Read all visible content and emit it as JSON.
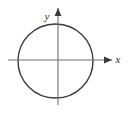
{
  "figure": {
    "background_color": "#ffffff",
    "width": 128,
    "height": 113
  },
  "axes": {
    "x_axis": {
      "label": "x",
      "label_x": 118,
      "label_y": 63,
      "line_start_x": 8,
      "line_end_x": 112,
      "line_y": 60,
      "color": "#6e6e6e",
      "arrow": "right-arrowhead"
    },
    "y_axis": {
      "label": "y",
      "label_x": 45,
      "label_y": 20,
      "line_top_y": 8,
      "line_bottom_y": 105,
      "line_x": 58,
      "color": "#6e6e6e",
      "arrow": "up-arrowhead"
    },
    "origin": {
      "x": 58,
      "y": 60
    }
  },
  "shapes": [
    {
      "kind": "circle",
      "name": "circle-curve",
      "center_x": 55.5,
      "center_y": 61,
      "radius_x": 37.5,
      "radius_y": 37,
      "stroke_color": "#3a3a3a",
      "stroke_width": 1.4,
      "fill": "none"
    }
  ]
}
